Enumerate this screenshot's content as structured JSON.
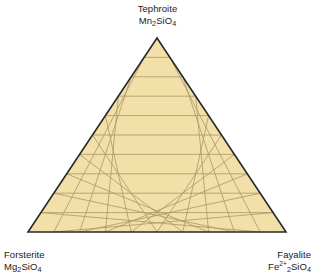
{
  "figure": {
    "type": "ternary-diagram",
    "background_color": "#ffffff"
  },
  "corners": {
    "top": {
      "name": "Tephroite",
      "formula_parts": [
        {
          "text": "Mn",
          "style": "normal"
        },
        {
          "text": "2",
          "style": "sub"
        },
        {
          "text": "SiO",
          "style": "normal"
        },
        {
          "text": "4",
          "style": "sub"
        }
      ],
      "formula_plain": "Mn2SiO4"
    },
    "bottom_left": {
      "name": "Forsterite",
      "formula_parts": [
        {
          "text": "Mg",
          "style": "normal"
        },
        {
          "text": "2",
          "style": "sub"
        },
        {
          "text": "SiO",
          "style": "normal"
        },
        {
          "text": "4",
          "style": "sub"
        }
      ],
      "formula_plain": "Mg2SiO4"
    },
    "bottom_right": {
      "name": "Fayalite",
      "formula_parts": [
        {
          "text": "Fe",
          "style": "normal"
        },
        {
          "text": "2+",
          "style": "sup"
        },
        {
          "text": "2",
          "style": "sub"
        },
        {
          "text": "SiO",
          "style": "normal"
        },
        {
          "text": "4",
          "style": "sub"
        }
      ],
      "formula_plain": "Fe2+2SiO4"
    }
  },
  "chart_data": {
    "type": "ternary",
    "title": "",
    "axes": [
      {
        "position": "top",
        "label": "Tephroite Mn2SiO4",
        "component": "Mn2SiO4"
      },
      {
        "position": "bottom-left",
        "label": "Forsterite Mg2SiO4",
        "component": "Mg2SiO4"
      },
      {
        "position": "bottom-right",
        "label": "Fayalite Fe2+2SiO4",
        "component": "Fe2SiO4"
      }
    ],
    "grid": true,
    "grid_divisions": 10,
    "tick_labels": [],
    "legend": null,
    "data_points": [],
    "annotations": [],
    "geometry": {
      "apex": [
        157,
        38
      ],
      "bottom_left": [
        28,
        232
      ],
      "bottom_right": [
        286,
        232
      ]
    }
  },
  "style": {
    "fill_color": "#f2e0a8",
    "grid_color": "#a89868",
    "border_color": "#2a2a28",
    "text_color": "#1a1a1a",
    "border_width": 1.6,
    "grid_width": 0.8
  }
}
